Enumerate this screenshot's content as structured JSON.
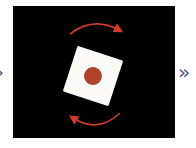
{
  "navigation": {
    "prev_glyph": "›",
    "next_glyph": "»"
  },
  "illustration": {
    "subject": "rotate-icon",
    "background_color": "#000000",
    "card_color": "#fbfaf7",
    "dot_color": "#b0442a",
    "arrow_color": "#d23a2e",
    "rotation_degrees": 18
  },
  "colors": {
    "chevron": "#5b5b86"
  }
}
